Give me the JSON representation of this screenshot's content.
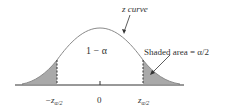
{
  "diagram": {
    "curve_label": "z curve",
    "center_region_label": "1 − α",
    "tail_annotation": "Shaded area = α/2",
    "axis_labels": {
      "left": "−z",
      "left_sub": "α/2",
      "center": "0",
      "right": "z",
      "right_sub": "α/2"
    },
    "colors": {
      "shade": "#a9a9a9",
      "curve": "#8a8a8a",
      "axis": "#333333"
    }
  }
}
